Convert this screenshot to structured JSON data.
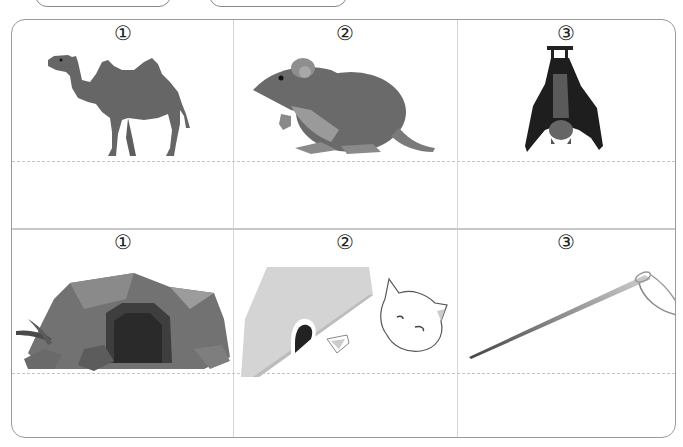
{
  "header_pills": [
    {
      "label": ""
    },
    {
      "label": ""
    }
  ],
  "rows": [
    {
      "items": [
        {
          "number": "①",
          "picture": "camel",
          "answer": ""
        },
        {
          "number": "②",
          "picture": "rat",
          "answer": ""
        },
        {
          "number": "③",
          "picture": "hanging-bat",
          "answer": ""
        }
      ]
    },
    {
      "items": [
        {
          "number": "①",
          "picture": "cave",
          "answer": ""
        },
        {
          "number": "②",
          "picture": "mouse-hole-with-cat-and-cheese",
          "answer": ""
        },
        {
          "number": "③",
          "picture": "threaded-needle",
          "answer": ""
        }
      ]
    }
  ],
  "colors": {
    "border": "#9a9a9a",
    "grid_line": "#d6d6d6",
    "dashed_line": "#c4c4c4",
    "animal_gray": "#6b6b6b",
    "bat_black": "#1e1e1e"
  }
}
